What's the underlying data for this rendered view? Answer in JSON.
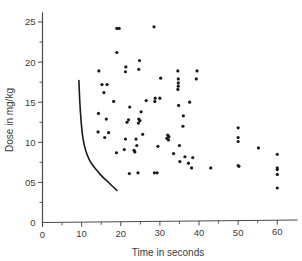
{
  "chart_data": {
    "type": "scatter",
    "title": "",
    "xlabel": "Time in seconds",
    "ylabel": "Dose in mg/kg",
    "xlim": [
      0,
      63
    ],
    "ylim": [
      0,
      26
    ],
    "grid": false,
    "legend": null,
    "x_ticks_major": [
      0,
      10,
      20,
      30,
      40,
      50,
      60
    ],
    "x_tick_labels": [
      "0",
      "10",
      "20",
      "30",
      "40",
      "50",
      "60"
    ],
    "x_ticks_minor": [
      5,
      15,
      25,
      35,
      45,
      55
    ],
    "y_ticks_major": [
      0,
      5,
      10,
      15,
      20,
      25
    ],
    "y_tick_labels": [
      "0",
      "05",
      "10",
      "15",
      "20",
      "25"
    ],
    "y_ticks_minor": [
      2.5,
      7.5,
      12.5,
      17.5,
      22.5
    ],
    "points": [
      [
        19.0,
        24.2
      ],
      [
        19.6,
        24.2
      ],
      [
        28.5,
        24.4
      ],
      [
        19.0,
        21.2
      ],
      [
        24.8,
        20.2
      ],
      [
        21.3,
        19.4
      ],
      [
        24.6,
        19.1
      ],
      [
        14.4,
        18.9
      ],
      [
        21.2,
        18.8
      ],
      [
        34.6,
        18.9
      ],
      [
        39.5,
        18.9
      ],
      [
        30.2,
        18.0
      ],
      [
        34.7,
        17.9
      ],
      [
        39.3,
        17.9
      ],
      [
        15.2,
        17.2
      ],
      [
        16.5,
        17.2
      ],
      [
        34.7,
        17.4
      ],
      [
        34.7,
        17.0
      ],
      [
        15.7,
        16.2
      ],
      [
        34.6,
        16.6
      ],
      [
        28.8,
        15.5
      ],
      [
        30.0,
        15.5
      ],
      [
        18.2,
        15.1
      ],
      [
        26.5,
        15.2
      ],
      [
        28.7,
        15.1
      ],
      [
        37.6,
        15.0
      ],
      [
        22.3,
        14.4
      ],
      [
        34.8,
        14.6
      ],
      [
        25.2,
        13.8
      ],
      [
        14.3,
        13.6
      ],
      [
        36.0,
        13.3
      ],
      [
        16.3,
        12.9
      ],
      [
        22.0,
        12.8
      ],
      [
        24.6,
        12.9
      ],
      [
        24.9,
        12.7
      ],
      [
        21.6,
        12.5
      ],
      [
        24.5,
        12.4
      ],
      [
        35.9,
        12.0
      ],
      [
        14.2,
        11.3
      ],
      [
        16.9,
        11.2
      ],
      [
        25.6,
        11.0
      ],
      [
        50.0,
        11.8
      ],
      [
        32.0,
        10.9
      ],
      [
        32.3,
        10.7
      ],
      [
        31.8,
        10.5
      ],
      [
        15.9,
        10.6
      ],
      [
        21.2,
        10.4
      ],
      [
        23.9,
        10.4
      ],
      [
        32.2,
        10.3
      ],
      [
        50.0,
        10.6
      ],
      [
        50.0,
        10.1
      ],
      [
        24.1,
        9.6
      ],
      [
        29.5,
        9.5
      ],
      [
        35.0,
        9.6
      ],
      [
        55.2,
        9.3
      ],
      [
        20.9,
        9.1
      ],
      [
        23.4,
        9.0
      ],
      [
        23.6,
        8.8
      ],
      [
        18.9,
        8.7
      ],
      [
        33.5,
        8.6
      ],
      [
        60.0,
        8.5
      ],
      [
        36.4,
        8.2
      ],
      [
        38.4,
        8.1
      ],
      [
        35.1,
        7.6
      ],
      [
        37.3,
        7.4
      ],
      [
        50.0,
        7.1
      ],
      [
        50.2,
        7.0
      ],
      [
        38.1,
        6.8
      ],
      [
        43.0,
        6.8
      ],
      [
        60.0,
        6.8
      ],
      [
        60.0,
        6.6
      ],
      [
        60.0,
        6.0
      ],
      [
        22.2,
        6.1
      ],
      [
        24.4,
        6.2
      ],
      [
        28.6,
        6.2
      ],
      [
        29.3,
        6.2
      ],
      [
        60.0,
        4.3
      ]
    ],
    "curve": {
      "label": "fitted-decay-curve",
      "points": [
        [
          9.3,
          17.7
        ],
        [
          9.5,
          15.2
        ],
        [
          9.8,
          13.0
        ],
        [
          10.1,
          11.3
        ],
        [
          10.5,
          10.0
        ],
        [
          11.0,
          9.0
        ],
        [
          11.6,
          8.2
        ],
        [
          12.3,
          7.5
        ],
        [
          13.2,
          6.9
        ],
        [
          14.2,
          6.3
        ],
        [
          15.3,
          5.7
        ],
        [
          16.5,
          5.2
        ],
        [
          17.7,
          4.6
        ],
        [
          19.0,
          4.0
        ]
      ]
    },
    "marker_style": {
      "shape": "circle",
      "radius": 1.6,
      "color": "#1a1a1a"
    },
    "axis_color": "#4a4a4a",
    "background_color": "#ffffff"
  }
}
